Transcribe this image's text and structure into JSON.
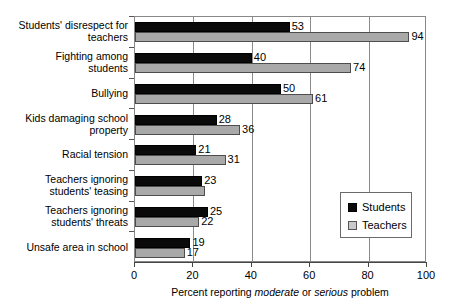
{
  "chart_data": {
    "type": "bar",
    "orientation": "horizontal",
    "title": "",
    "xlabel_parts": [
      "Percent reporting ",
      "moderate",
      " or ",
      "serious",
      " problem"
    ],
    "xlabel": "Percent reporting moderate or serious problem",
    "ylabel": "",
    "xlim": [
      0,
      100
    ],
    "xticks": [
      "0",
      "20",
      "40",
      "60",
      "80",
      "100"
    ],
    "grid": "vertical",
    "legend_position": "inside-right",
    "categories": [
      "Students' disrespect for\nteachers",
      "Fighting among\nstudents",
      "Bullying",
      "Kids damaging school\nproperty",
      "Racial tension",
      "Teachers ignoring\nstudents' teasing",
      "Teachers ignoring\nstudents' threats",
      "Unsafe area in school"
    ],
    "series": [
      {
        "name": "Students",
        "color": "#0a0a0a",
        "values": [
          53,
          40,
          50,
          28,
          21,
          23,
          25,
          19
        ],
        "labels": [
          "53",
          "40",
          "50",
          "28",
          "21",
          "23",
          "25",
          "19"
        ]
      },
      {
        "name": "Teachers",
        "color": "#a9a9a9",
        "values": [
          94,
          74,
          61,
          36,
          31,
          24,
          22,
          17
        ],
        "labels": [
          "94",
          "74",
          "61",
          "36",
          "31",
          "",
          "22",
          "17"
        ]
      }
    ]
  },
  "legend": {
    "items": [
      {
        "label": "Students"
      },
      {
        "label": "Teachers"
      }
    ]
  }
}
